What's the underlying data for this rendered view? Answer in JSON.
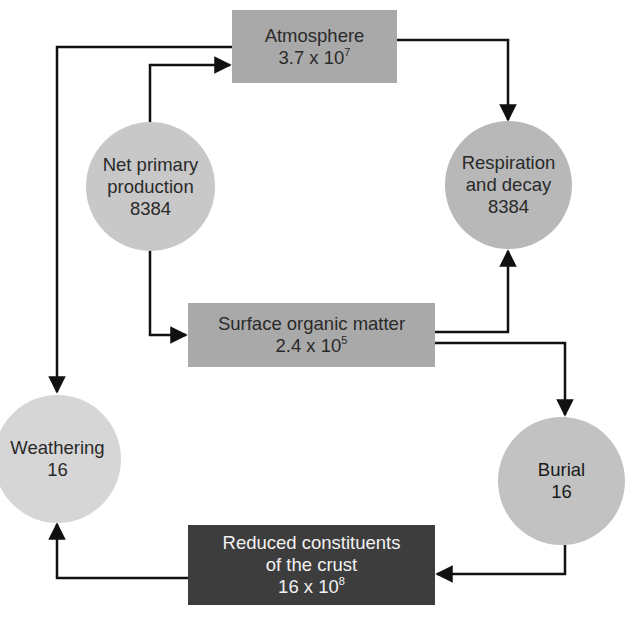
{
  "colors": {
    "box_mid": "#a9a9a9",
    "circle_mid": "#c2c2c2",
    "circle_light": "#d6d6d6",
    "box_dark": "#3d3d3d",
    "line": "#111111"
  },
  "nodes": {
    "atmosphere": {
      "label": "Atmosphere",
      "value_base": "3.7 x 10",
      "value_exp": "7"
    },
    "net_primary_production": {
      "line1": "Net primary",
      "line2": "production",
      "value": "8384"
    },
    "respiration_decay": {
      "line1": "Respiration",
      "line2": "and decay",
      "value": "8384"
    },
    "surface_organic_matter": {
      "label": "Surface organic matter",
      "value_base": "2.4 x 10",
      "value_exp": "5"
    },
    "weathering": {
      "label": "Weathering",
      "value": "16"
    },
    "burial": {
      "label": "Burial",
      "value": "16"
    },
    "reduced_crust": {
      "line1": "Reduced constituents",
      "line2": "of the crust",
      "value_base": "16 x 10",
      "value_exp": "8"
    }
  },
  "flows": [
    {
      "from": "net_primary_production",
      "to": "atmosphere"
    },
    {
      "from": "atmosphere",
      "to": "weathering"
    },
    {
      "from": "atmosphere",
      "to": "respiration_decay"
    },
    {
      "from": "net_primary_production",
      "to": "surface_organic_matter"
    },
    {
      "from": "surface_organic_matter",
      "to": "respiration_decay"
    },
    {
      "from": "surface_organic_matter",
      "to": "burial"
    },
    {
      "from": "burial",
      "to": "reduced_crust"
    },
    {
      "from": "reduced_crust",
      "to": "weathering"
    }
  ]
}
